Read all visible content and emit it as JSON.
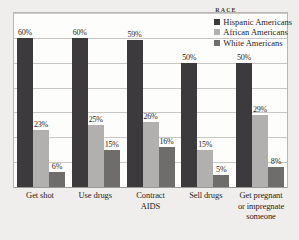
{
  "chart_data": {
    "type": "bar",
    "title": "",
    "xlabel": "",
    "ylabel": "",
    "ylim": [
      0,
      70
    ],
    "grid": true,
    "gridline_step": 10,
    "legend_position": "top-right-inside",
    "legend_title": "RACE",
    "categories": [
      "Get shot",
      "Use drugs",
      "Contract AIDS",
      "Sell drugs",
      "Get pregnant or impregnate someone"
    ],
    "category_lines": [
      [
        "Get shot"
      ],
      [
        "Use drugs"
      ],
      [
        "Contract AIDS"
      ],
      [
        "Sell drugs"
      ],
      [
        "Get pregnant",
        "or impregnate",
        "someone"
      ]
    ],
    "series": [
      {
        "name": "Hispanic Americans",
        "color": "#3d3a3d",
        "values": [
          60,
          60,
          59,
          50,
          50
        ],
        "labels": [
          "60%",
          "60%",
          "59%",
          "50%",
          "50%"
        ]
      },
      {
        "name": "African Americans",
        "color": "#b2b0ae",
        "values": [
          23,
          25,
          26,
          15,
          29
        ],
        "labels": [
          "23%",
          "25%",
          "26%",
          "15%",
          "29%"
        ]
      },
      {
        "name": "White Americans",
        "color": "#6f6d6c",
        "values": [
          6,
          15,
          16,
          5,
          8
        ],
        "labels": [
          "6%",
          "15%",
          "16%",
          "5%",
          "8%"
        ]
      }
    ]
  }
}
